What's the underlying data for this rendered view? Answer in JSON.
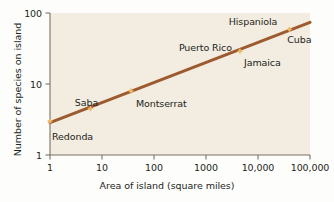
{
  "chart_data": {
    "type": "scatter",
    "title": "",
    "xlabel": "Area of island (square miles)",
    "ylabel": "Number of species on island",
    "xscale": "log",
    "yscale": "log",
    "xlim": [
      1,
      100000
    ],
    "ylim": [
      1,
      100
    ],
    "grid": false,
    "legend": "none",
    "x_ticks": [
      "1",
      "10",
      "100",
      "1000",
      "10,000",
      "100,000"
    ],
    "x_tick_values": [
      1,
      10,
      100,
      1000,
      10000,
      100000
    ],
    "y_ticks": [
      "100",
      "10",
      "1"
    ],
    "y_tick_values": [
      100,
      10,
      1
    ],
    "points": [
      {
        "label": "Redonda",
        "x": 1,
        "y": 3,
        "label_dx": 2,
        "label_dy": 17,
        "anchor": "start"
      },
      {
        "label": "Saba",
        "x": 6,
        "y": 4.5,
        "label_dx": -4,
        "label_dy": -5,
        "anchor": "mid"
      },
      {
        "label": "Montserrat",
        "x": 36,
        "y": 8,
        "label_dx": 5,
        "label_dy": 14,
        "anchor": "start"
      },
      {
        "label": "Puerto Rico",
        "x": 4500,
        "y": 29,
        "label_dx": -8,
        "label_dy": -2,
        "anchor": "end"
      },
      {
        "label": "Jamaica",
        "x": 4500,
        "y": 29,
        "label_dx": 4,
        "label_dy": 13,
        "anchor": "start"
      },
      {
        "label": "Hispaniola",
        "x": 40000,
        "y": 59,
        "label_dx": -12,
        "label_dy": -6,
        "anchor": "end"
      },
      {
        "label": "Cuba",
        "x": 40000,
        "y": 59,
        "label_dx": -2,
        "label_dy": 12,
        "anchor": "start"
      }
    ],
    "trend_line": {
      "description": "species-area regression line",
      "x_start": 1,
      "y_start": 2.85,
      "x_end": 100000,
      "y_end": 74
    },
    "colors": {
      "plot_background": "#f3ece0",
      "line": "#9c5a2e",
      "marker": "#f0b862",
      "axis": "#7a7164",
      "text": "#231f1c",
      "figure_background": "#fdfdfb"
    }
  }
}
